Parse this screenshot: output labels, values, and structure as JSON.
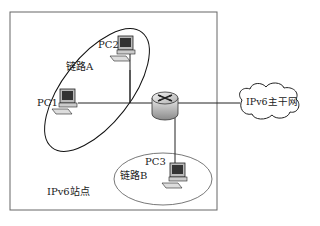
{
  "diagram": {
    "site_label": "IPv6站点",
    "backbone_label": "IPv6主干网",
    "links": [
      {
        "label": "链路A"
      },
      {
        "label": "链路B"
      }
    ],
    "hosts": [
      {
        "label": "PC1"
      },
      {
        "label": "PC2"
      },
      {
        "label": "PC3"
      }
    ],
    "router": {
      "name": "router-icon"
    }
  }
}
